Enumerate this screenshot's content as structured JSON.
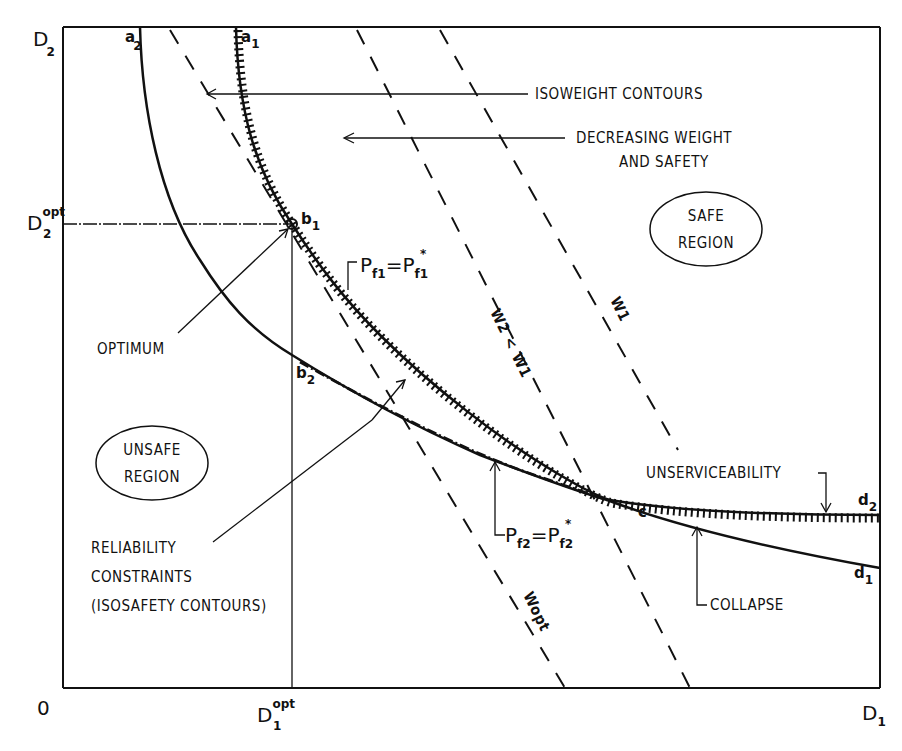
{
  "axes": {
    "origin": "0",
    "x_label": "D",
    "x_sub": "1",
    "y_label": "D",
    "y_sub": "2",
    "x_opt_label": "D",
    "x_opt_sub": "1",
    "x_opt_sup": "opt",
    "y_opt_label": "D",
    "y_opt_sub": "2",
    "y_opt_sup": "opt"
  },
  "points": {
    "a1": {
      "base": "a",
      "sub": "1"
    },
    "a2": {
      "base": "a",
      "sub": "2"
    },
    "b1": {
      "base": "b",
      "sub": "1"
    },
    "b2": {
      "base": "b",
      "sub": "2"
    },
    "c": {
      "base": "c"
    },
    "d1": {
      "base": "d",
      "sub": "1"
    },
    "d2": {
      "base": "d",
      "sub": "2"
    }
  },
  "annotations": {
    "isoweight": "ISOWEIGHT CONTOURS",
    "decreasing_line1": "DECREASING WEIGHT",
    "decreasing_line2": "AND SAFETY",
    "safe_line1": "SAFE",
    "safe_line2": "REGION",
    "unsafe_line1": "UNSAFE",
    "unsafe_line2": "REGION",
    "optimum": "OPTIMUM",
    "reliability_line1": "RELIABILITY",
    "reliability_line2": "CONSTRAINTS",
    "reliability_line3": "(ISOSAFETY CONTOURS)",
    "unserviceability": "UNSERVICEABILITY",
    "collapse": "COLLAPSE",
    "pf1": {
      "p": "P",
      "sub": "f1",
      "eq": "=",
      "p2": "P",
      "sub2": "f1",
      "star": "*"
    },
    "pf2": {
      "p": "P",
      "sub": "f2",
      "eq": "=",
      "p2": "P",
      "sub2": "f2",
      "star": "*"
    }
  },
  "contours": {
    "w1": "W1",
    "w2_lt_w1_a": "W2",
    "w2_lt_w1_op": "<",
    "w2_lt_w1_b": "W1",
    "wopt": "Wopt"
  },
  "colors": {
    "ink": "#111111",
    "background": "#ffffff"
  }
}
